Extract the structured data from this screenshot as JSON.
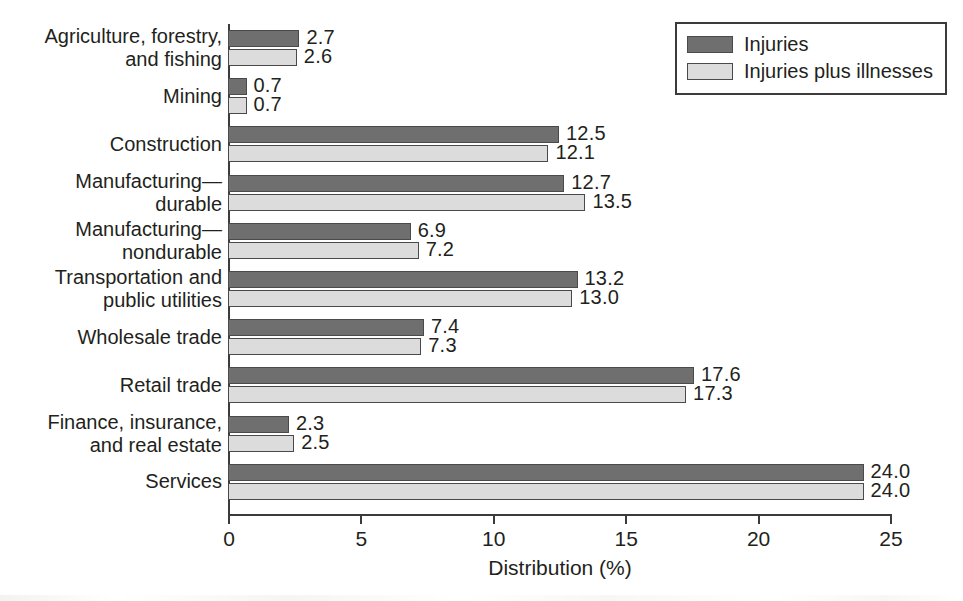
{
  "chart_data": {
    "type": "bar",
    "orientation": "horizontal",
    "title": "",
    "xlabel": "Distribution (%)",
    "ylabel": "",
    "xlim": [
      0,
      25
    ],
    "xticks": [
      "0",
      "5",
      "10",
      "15",
      "20",
      "25"
    ],
    "grid": false,
    "legend_position": "top-right",
    "categories": [
      "Agriculture, forestry,\nand fishing",
      "Mining",
      "Construction",
      "Manufacturing—\ndurable",
      "Manufacturing—\nnondurable",
      "Transportation and\npublic utilities",
      "Wholesale trade",
      "Retail trade",
      "Finance, insurance,\nand real estate",
      "Services"
    ],
    "series": [
      {
        "name": "Injuries",
        "color": "#6f6f6f",
        "values": [
          2.7,
          0.7,
          12.5,
          12.7,
          6.9,
          13.2,
          7.4,
          17.6,
          2.3,
          24.0
        ],
        "labels": [
          "2.7",
          "0.7",
          "12.5",
          "12.7",
          "6.9",
          "13.2",
          "7.4",
          "17.6",
          "2.3",
          "24.0"
        ]
      },
      {
        "name": "Injuries plus illnesses",
        "color": "#dcdcdc",
        "values": [
          2.6,
          0.7,
          12.1,
          13.5,
          7.2,
          13.0,
          7.3,
          17.3,
          2.5,
          24.0
        ],
        "labels": [
          "2.6",
          "0.7",
          "12.1",
          "13.5",
          "7.2",
          "13.0",
          "7.3",
          "17.3",
          "2.5",
          "24.0"
        ]
      }
    ]
  }
}
